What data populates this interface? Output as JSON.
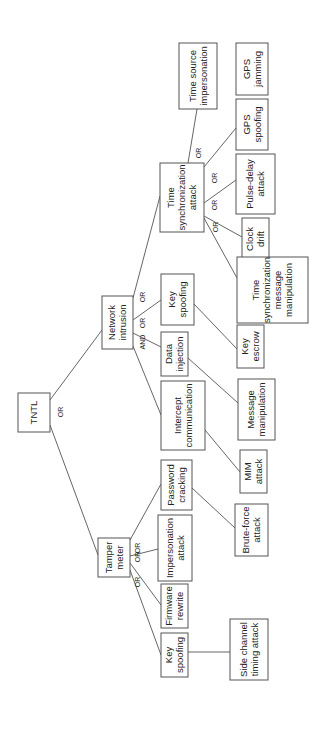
{
  "diagram": {
    "type": "attack-tree",
    "orientation": "rotated-90-ccw",
    "line_color": "#555555",
    "nodes": [
      {
        "id": "tntl",
        "lines": [
          "TNTL"
        ],
        "box": [
          18,
          393,
          32,
          39
        ]
      },
      {
        "id": "network-intrusion",
        "lines": [
          "Network",
          "intrusion"
        ],
        "box": [
          102,
          296,
          31,
          53
        ]
      },
      {
        "id": "tamper-meter",
        "lines": [
          "Tamper",
          "meter"
        ],
        "box": [
          98,
          538,
          32,
          39
        ]
      },
      {
        "id": "time-synchronization-attack",
        "lines": [
          "Time",
          "synchronization",
          "attack"
        ],
        "box": [
          160,
          163,
          44,
          69
        ]
      },
      {
        "id": "key-spoofing-ni",
        "lines": [
          "Key",
          "spoofing"
        ],
        "box": [
          161,
          274,
          33,
          51
        ]
      },
      {
        "id": "data-injection",
        "lines": [
          "Data",
          "injection"
        ],
        "box": [
          161,
          332,
          27,
          44
        ]
      },
      {
        "id": "intercept-communication",
        "lines": [
          "Intercept",
          "communication"
        ],
        "box": [
          161,
          381,
          44,
          69
        ]
      },
      {
        "id": "password-cracking",
        "lines": [
          "Password",
          "cracking"
        ],
        "box": [
          161,
          460,
          31,
          50
        ]
      },
      {
        "id": "impersonation-attack",
        "lines": [
          "Impersonation",
          "attack"
        ],
        "box": [
          158,
          515,
          34,
          66
        ]
      },
      {
        "id": "firmware-rewrite",
        "lines": [
          "Firmware",
          "rewrite"
        ],
        "box": [
          161,
          584,
          27,
          44
        ]
      },
      {
        "id": "key-spoofing-tm",
        "lines": [
          "Key",
          "spoofing"
        ],
        "box": [
          161,
          633,
          27,
          44
        ]
      },
      {
        "id": "time-source-impersonation",
        "lines": [
          "Time source",
          "impersonation"
        ],
        "box": [
          179,
          43,
          38,
          66
        ]
      },
      {
        "id": "gps-jamming",
        "lines": [
          "GPS",
          "jamming"
        ],
        "box": [
          236,
          43,
          32,
          52
        ]
      },
      {
        "id": "gps-spoofing",
        "lines": [
          "GPS",
          "spoofing"
        ],
        "box": [
          236,
          99,
          32,
          51
        ]
      },
      {
        "id": "pulse-delay-attack",
        "lines": [
          "Pulse-delay",
          "attack"
        ],
        "box": [
          236,
          154,
          39,
          60
        ]
      },
      {
        "id": "clock-drift",
        "lines": [
          "Clock",
          "drift"
        ],
        "box": [
          242,
          218,
          27,
          42
        ]
      },
      {
        "id": "time-sync-message-manipulation",
        "lines": [
          "Time",
          "synchronization",
          "message",
          "manipulation"
        ],
        "box": [
          237,
          257,
          71,
          66
        ]
      },
      {
        "id": "key-escrow",
        "lines": [
          "Key",
          "escrow"
        ],
        "box": [
          237,
          325,
          27,
          43
        ]
      },
      {
        "id": "message-manipulation",
        "lines": [
          "Message",
          "manipulation"
        ],
        "box": [
          238,
          379,
          37,
          61
        ]
      },
      {
        "id": "mim-attack",
        "lines": [
          "MIM",
          "attack"
        ],
        "box": [
          240,
          450,
          27,
          43
        ]
      },
      {
        "id": "brute-force-attack",
        "lines": [
          "Brute-force",
          "attack"
        ],
        "box": [
          235,
          504,
          33,
          52
        ]
      },
      {
        "id": "side-channel-timing-attack",
        "lines": [
          "Side channel",
          "timing attack"
        ],
        "box": [
          230,
          619,
          38,
          61
        ]
      }
    ],
    "edges": [
      {
        "from": "tntl",
        "to": "network-intrusion",
        "pts": [
          50,
          400,
          102,
          330
        ]
      },
      {
        "from": "tntl",
        "to": "tamper-meter",
        "pts": [
          50,
          425,
          98,
          555
        ]
      },
      {
        "from": "network-intrusion",
        "to": "time-synchronization-attack",
        "pts": [
          133,
          298,
          160,
          196
        ]
      },
      {
        "from": "network-intrusion",
        "to": "key-spoofing-ni",
        "pts": [
          133,
          320,
          161,
          300
        ]
      },
      {
        "from": "network-intrusion",
        "to": "data-injection",
        "pts": [
          133,
          333,
          161,
          347
        ]
      },
      {
        "from": "network-intrusion",
        "to": "intercept-communication",
        "pts": [
          133,
          346,
          161,
          415
        ]
      },
      {
        "from": "tamper-meter",
        "to": "password-cracking",
        "pts": [
          130,
          540,
          161,
          484
        ]
      },
      {
        "from": "tamper-meter",
        "to": "impersonation-attack",
        "pts": [
          130,
          556,
          158,
          549
        ]
      },
      {
        "from": "tamper-meter",
        "to": "firmware-rewrite",
        "pts": [
          130,
          563,
          161,
          605
        ]
      },
      {
        "from": "tamper-meter",
        "to": "key-spoofing-tm",
        "pts": [
          130,
          570,
          161,
          655
        ]
      },
      {
        "from": "time-synchronization-attack",
        "to": "time-source-impersonation",
        "pts": [
          188,
          163,
          197,
          109
        ]
      },
      {
        "from": "time-synchronization-attack",
        "to": "gps-spoofing",
        "pts": [
          204,
          167,
          236,
          128
        ]
      },
      {
        "from": "time-synchronization-attack",
        "to": "pulse-delay-attack",
        "pts": [
          204,
          203,
          236,
          180
        ]
      },
      {
        "from": "time-synchronization-attack",
        "to": "clock-drift",
        "pts": [
          204,
          216,
          242,
          237
        ]
      },
      {
        "from": "time-synchronization-attack",
        "to": "time-sync-message-manipulation",
        "pts": [
          204,
          218,
          237,
          278
        ]
      },
      {
        "from": "key-spoofing-ni",
        "to": "key-escrow",
        "pts": [
          194,
          304,
          237,
          349
        ]
      },
      {
        "from": "data-injection",
        "to": "message-manipulation",
        "pts": [
          188,
          358,
          238,
          403
        ]
      },
      {
        "from": "intercept-communication",
        "to": "mim-attack",
        "pts": [
          205,
          430,
          240,
          472
        ]
      },
      {
        "from": "password-cracking",
        "to": "brute-force-attack",
        "pts": [
          192,
          488,
          235,
          528
        ]
      },
      {
        "from": "key-spoofing-tm",
        "to": "side-channel-timing-attack",
        "pts": [
          188,
          652,
          230,
          652
        ]
      }
    ],
    "gates": [
      {
        "label": "OR",
        "x": 61,
        "y": 412
      },
      {
        "label": "OR",
        "x": 143,
        "y": 297
      },
      {
        "label": "OR",
        "x": 143,
        "y": 323
      },
      {
        "label": "AND",
        "x": 143,
        "y": 342
      },
      {
        "label": "OR",
        "x": 199,
        "y": 153
      },
      {
        "label": "OR",
        "x": 215,
        "y": 178
      },
      {
        "label": "OR",
        "x": 215,
        "y": 205
      },
      {
        "label": "OR",
        "x": 216,
        "y": 227
      },
      {
        "label": "OR",
        "x": 138,
        "y": 548
      },
      {
        "label": "OR",
        "x": 138,
        "y": 557
      },
      {
        "label": "OR",
        "x": 138,
        "y": 582
      }
    ]
  }
}
